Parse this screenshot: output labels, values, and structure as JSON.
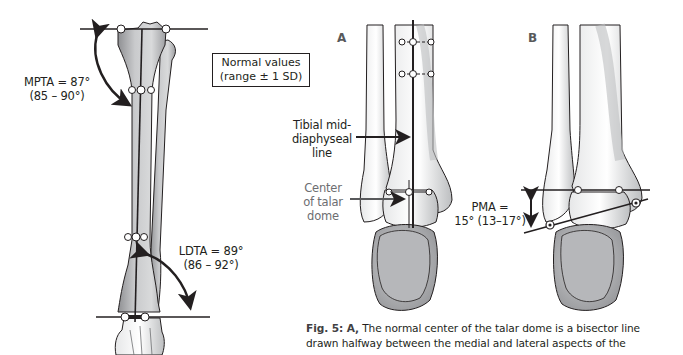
{
  "figure": {
    "left_panel": {
      "mpta": {
        "label": "MPTA = 87°",
        "range": "(85 – 90°)"
      },
      "ldta": {
        "label": "LDTA = 89°",
        "range": "(86 – 92°)"
      },
      "legend": {
        "line1": "Normal values",
        "line2": "(range ± 1 SD)"
      }
    },
    "panel_a": {
      "letter": "A",
      "label_midline": {
        "line1": "Tibial mid-",
        "line2": "diaphyseal",
        "line3": "line"
      },
      "label_talar": {
        "line1": "Center",
        "line2": "of talar",
        "line3": "dome"
      }
    },
    "panel_b": {
      "letter": "B",
      "pma": {
        "line1": "PMA =",
        "line2": "15° (13–17°)"
      }
    },
    "caption": {
      "prefix": "Fig. 5: A,",
      "line1": " The normal center of the talar dome is a bisector line",
      "line2": "drawn halfway between the medial and lateral aspects of the"
    }
  },
  "colors": {
    "bone": "#c7c8ca",
    "bone_shadow": "#939598",
    "outline": "#231f20",
    "text": "#231f20",
    "label_gray": "#6d6e71"
  }
}
